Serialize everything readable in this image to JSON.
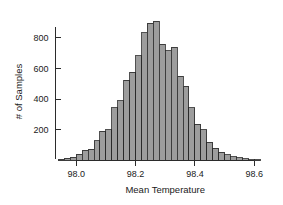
{
  "chart_data": {
    "type": "bar",
    "title": "",
    "subtitle": "",
    "xlabel": "Mean Temperature",
    "ylabel": "# of Samples",
    "grid": false,
    "legend": null,
    "legend_position": "none",
    "xlim": [
      97.93,
      98.66
    ],
    "ylim": [
      0,
      930
    ],
    "xticks": [
      98.0,
      98.2,
      98.4,
      98.6
    ],
    "xtick_labels": [
      "98.0",
      "98.2",
      "98.4",
      "98.6"
    ],
    "yticks": [
      200,
      400,
      600,
      800
    ],
    "ytick_labels": [
      "200",
      "400",
      "600",
      "800"
    ],
    "bin_width": 0.02,
    "bar_color": "#9d9d9d",
    "bar_edge_color": "#262626",
    "axis_color": "#2b2b2b",
    "categories": [
      "97.95",
      "97.97",
      "97.99",
      "98.01",
      "98.03",
      "98.05",
      "98.07",
      "98.09",
      "98.11",
      "98.13",
      "98.15",
      "98.17",
      "98.19",
      "98.21",
      "98.23",
      "98.25",
      "98.27",
      "98.29",
      "98.31",
      "98.33",
      "98.35",
      "98.37",
      "98.39",
      "98.41",
      "98.43",
      "98.45",
      "98.47",
      "98.49",
      "98.51",
      "98.53",
      "98.55",
      "98.57",
      "98.59",
      "98.61"
    ],
    "bin_centers": [
      97.95,
      97.97,
      97.99,
      98.01,
      98.03,
      98.05,
      98.07,
      98.09,
      98.11,
      98.13,
      98.15,
      98.17,
      98.19,
      98.21,
      98.23,
      98.25,
      98.27,
      98.29,
      98.31,
      98.33,
      98.35,
      98.37,
      98.39,
      98.41,
      98.43,
      98.45,
      98.47,
      98.49,
      98.51,
      98.53,
      98.55,
      98.57,
      98.59,
      98.61
    ],
    "values": [
      8,
      14,
      22,
      40,
      68,
      75,
      130,
      190,
      200,
      345,
      390,
      525,
      575,
      685,
      835,
      895,
      910,
      760,
      715,
      740,
      550,
      485,
      345,
      235,
      200,
      120,
      80,
      55,
      38,
      25,
      18,
      10,
      6,
      4
    ]
  },
  "figure": {
    "background_color": "#ffffff"
  }
}
